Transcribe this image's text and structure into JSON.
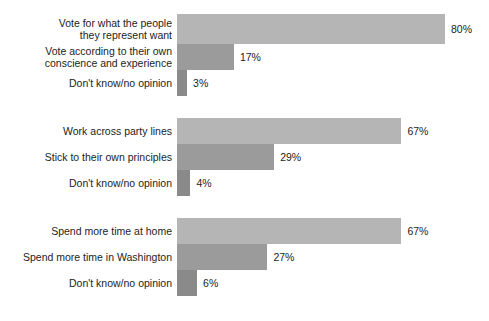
{
  "chart_data": {
    "type": "bar",
    "orientation": "horizontal",
    "title": "",
    "xlabel": "",
    "ylabel": "",
    "xlim": [
      0,
      80
    ],
    "grid": false,
    "legend": "none",
    "value_suffix": "%",
    "bar_colors": [
      "#b5b5b5",
      "#9b9b9b",
      "#8a8a8a"
    ],
    "groups": [
      {
        "name": "representation",
        "categories": [
          "Vote for what the people\nthey represent want",
          "Vote according to their own\nconscience and experience",
          "Don't know/no opinion"
        ],
        "values": [
          80,
          17,
          3
        ],
        "value_labels": [
          "80%",
          "17%",
          "3%"
        ]
      },
      {
        "name": "party-lines",
        "categories": [
          "Work across party lines",
          "Stick to their own principles",
          "Don't know/no opinion"
        ],
        "values": [
          67,
          29,
          4
        ],
        "value_labels": [
          "67%",
          "29%",
          "4%"
        ]
      },
      {
        "name": "time-location",
        "categories": [
          "Spend more time at home",
          "Spend more time in Washington",
          "Don't know/no opinion"
        ],
        "values": [
          67,
          27,
          6
        ],
        "value_labels": [
          "67%",
          "27%",
          "6%"
        ]
      }
    ]
  },
  "layout": {
    "bar_origin_x": 177,
    "px_per_percent": 3.35,
    "groups": [
      {
        "top": 14,
        "row_heights": [
          30,
          26,
          26
        ]
      },
      {
        "top": 118,
        "row_heights": [
          26,
          26,
          26
        ]
      },
      {
        "top": 218,
        "row_heights": [
          26,
          26,
          26
        ]
      }
    ]
  }
}
